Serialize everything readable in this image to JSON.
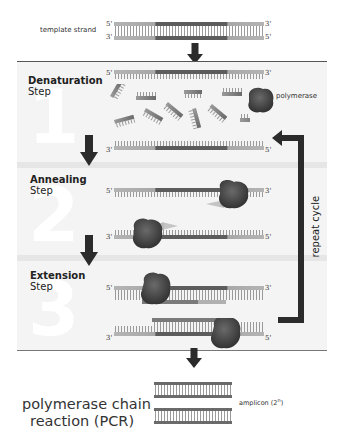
{
  "top": {
    "template_label": "template strand",
    "strand_top_left": "5'",
    "strand_top_right": "3'",
    "strand_bottom_left": "3'",
    "strand_bottom_right": "5'"
  },
  "steps": [
    {
      "number": "1",
      "title": "Denaturation",
      "subtitle": "Step",
      "strand1": {
        "left": "5'",
        "right": "3'"
      },
      "strand2": {
        "left": "3'",
        "right": "5'"
      },
      "polymerase_label": "polymerase"
    },
    {
      "number": "2",
      "title": "Annealing",
      "subtitle": "Step",
      "strand1": {
        "left": "5'",
        "right": "3'"
      },
      "strand2": {
        "left": "3'",
        "right": "5'"
      }
    },
    {
      "number": "3",
      "title": "Extension",
      "subtitle": "Step",
      "strand1": {
        "left": "5'",
        "right": "3'"
      },
      "strand2": {
        "left": "3'",
        "right": "5'"
      }
    }
  ],
  "cycle_label": "repeat cycle",
  "footer": {
    "title_line1": "polymerase chain",
    "title_line2": "reaction (PCR)",
    "amplicon_label": "amplicon (2",
    "amplicon_exp": "n",
    "amplicon_close": ")"
  },
  "colors": {
    "strand_light": "#a9a9a9",
    "strand_dark": "#5a5a5a",
    "polymerase": "#4a4a4a",
    "arrow": "#2b2b2b",
    "panel_bg": "#f4f4f4"
  }
}
